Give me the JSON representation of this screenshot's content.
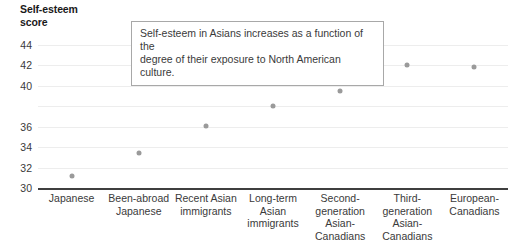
{
  "chart_data": {
    "type": "scatter",
    "title_lines": [
      "Self-esteem",
      "score"
    ],
    "xlabel": "",
    "ylabel": "Self-esteem score",
    "ylim": [
      30,
      45
    ],
    "grid": true,
    "legend": "none",
    "ytick_labels": [
      "44",
      "42",
      "40",
      "36",
      "34",
      "32",
      "30"
    ],
    "ytick_values": [
      44,
      42,
      40,
      38,
      36,
      34,
      32,
      30
    ],
    "categories": [
      "Japanese",
      "Been-abroad Japanese",
      "Recent Asian immigrants",
      "Long-term Asian immigrants",
      "Second-generation Asian-Canadians",
      "Third-generation Asian-Canadians",
      "European-Canadians"
    ],
    "category_lines": [
      [
        "Japanese"
      ],
      [
        "Been-abroad",
        "Japanese"
      ],
      [
        "Recent Asian",
        "immigrants"
      ],
      [
        "Long-term",
        "Asian",
        "immigrants"
      ],
      [
        "Second-",
        "generation",
        "Asian-",
        "Canadians"
      ],
      [
        "Third-",
        "generation",
        "Asian-",
        "Canadians"
      ],
      [
        "European-",
        "Canadians"
      ]
    ],
    "values": [
      31.2,
      33.4,
      36.1,
      38.0,
      39.5,
      42.0,
      41.8
    ],
    "annotations": [
      {
        "text": "Self-esteem in Asians increases as a function of the degree of their exposure to North American culture.",
        "lines": [
          "Self-esteem in Asians increases as a function of the",
          "degree of their exposure to North American culture."
        ]
      }
    ],
    "colors": {
      "marker": "#9a9a9a",
      "gridline": "#ededed",
      "axis": "#3f3f3f",
      "text": "#3a3a3a",
      "title": "#1a1a1a",
      "annotation_border": "#a8a8a8",
      "background": "#ffffff"
    }
  }
}
